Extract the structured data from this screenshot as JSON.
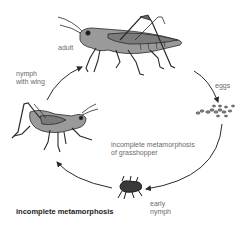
{
  "diagram": {
    "title": "incomplete metamorphosis",
    "center_caption": "incomplete metamorphosis\nof grasshopper",
    "stages": [
      {
        "id": "adult",
        "label": "adult"
      },
      {
        "id": "eggs",
        "label": "eggs"
      },
      {
        "id": "early_nymph",
        "label": "early\nnymph"
      },
      {
        "id": "nymph_with_wing",
        "label": "nymph\nwith wing"
      }
    ],
    "cycle_order": [
      "eggs",
      "early_nymph",
      "nymph_with_wing",
      "adult"
    ],
    "colors": {
      "ink": "#2a2a2a",
      "body_fill": "#8a8a8a",
      "label_text": "#6a6a6a",
      "title_text": "#1a1a1a"
    }
  }
}
